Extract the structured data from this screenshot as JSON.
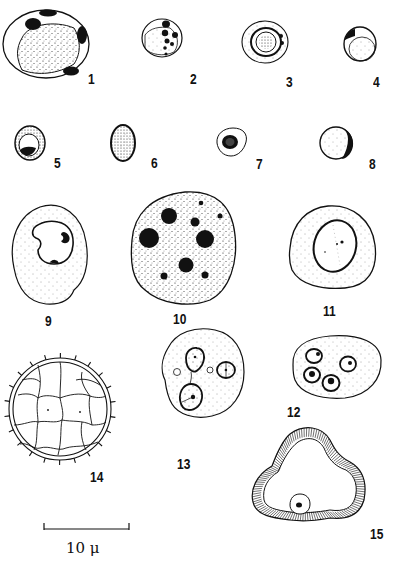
{
  "plate": {
    "figures": [
      {
        "id": "fig-1",
        "label": "1"
      },
      {
        "id": "fig-2",
        "label": "2"
      },
      {
        "id": "fig-3",
        "label": "3"
      },
      {
        "id": "fig-4",
        "label": "4"
      },
      {
        "id": "fig-5",
        "label": "5"
      },
      {
        "id": "fig-6",
        "label": "6"
      },
      {
        "id": "fig-7",
        "label": "7"
      },
      {
        "id": "fig-8",
        "label": "8"
      },
      {
        "id": "fig-9",
        "label": "9"
      },
      {
        "id": "fig-10",
        "label": "10"
      },
      {
        "id": "fig-11",
        "label": "11"
      },
      {
        "id": "fig-12",
        "label": "12"
      },
      {
        "id": "fig-13",
        "label": "13"
      },
      {
        "id": "fig-14",
        "label": "14"
      },
      {
        "id": "fig-15",
        "label": "15"
      }
    ],
    "scale_bar": {
      "label": "10 μ",
      "value": 10,
      "unit": "μ"
    }
  },
  "colors": {
    "ink": "#111111",
    "paper": "#ffffff"
  }
}
